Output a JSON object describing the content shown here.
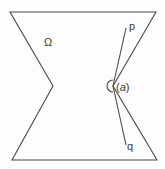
{
  "diagram": {
    "region_label": "Ω",
    "ray_top_label": "p",
    "ray_bottom_label": "q",
    "angle_label_open": "(",
    "angle_label_var": "a",
    "angle_label_close": ")",
    "stroke_color": "#4a4a4a",
    "background_color": "#fdfdfd"
  }
}
